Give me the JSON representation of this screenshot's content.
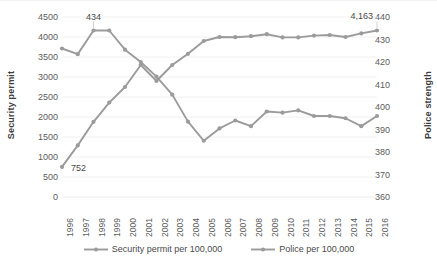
{
  "chart_data": {
    "type": "line",
    "title": "",
    "xlabel": "",
    "ylabel": "Security permit",
    "y2label": "Police strength",
    "grid": true,
    "legend_position": "bottom",
    "categories": [
      "1996",
      "1997",
      "1998",
      "1999",
      "2000",
      "2001",
      "2002",
      "2003",
      "2004",
      "2005",
      "2006",
      "2007",
      "2008",
      "2009",
      "2010",
      "2011",
      "2012",
      "2013",
      "2014",
      "2015",
      "2016"
    ],
    "ylim": [
      0,
      4500
    ],
    "yticks": [
      "0",
      "500",
      "1000",
      "1500",
      "2000",
      "2500",
      "3000",
      "3500",
      "4000",
      "4500"
    ],
    "y2lim": [
      360,
      440
    ],
    "y2ticks": [
      "360",
      "370",
      "380",
      "390",
      "400",
      "410",
      "420",
      "430",
      "440"
    ],
    "series": [
      {
        "name": "Security permit per 100,000",
        "axis": "left",
        "color": "#9b9b9b",
        "values": [
          752,
          1290,
          1880,
          2360,
          2750,
          3300,
          2900,
          3300,
          3580,
          3900,
          4000,
          3995,
          4020,
          4070,
          3990,
          3990,
          4035,
          4050,
          4000,
          4090,
          4163
        ]
      },
      {
        "name": "Police per 100,000",
        "axis": "right",
        "color": "#9b9b9b",
        "values": [
          426.0,
          423.5,
          434.0,
          434.0,
          425.5,
          420.0,
          413.5,
          405.5,
          393.5,
          385.0,
          390.5,
          394.0,
          391.5,
          398.0,
          397.5,
          398.5,
          396.0,
          396.0,
          395.0,
          391.5,
          396.0
        ]
      }
    ],
    "annotations": [
      {
        "label": "752",
        "series": "Security permit per 100,000",
        "category": "1996",
        "value": 752
      },
      {
        "label": "434",
        "series": "Police per 100,000",
        "category": "1998",
        "value": 434
      },
      {
        "label": "4,163",
        "series": "Security permit per 100,000",
        "category": "2016",
        "value": 4163
      }
    ]
  },
  "legend": {
    "items": [
      {
        "label": "Security permit per 100,000"
      },
      {
        "label": "Police per 100,000"
      }
    ]
  },
  "axes": {
    "left_title": "Security permit",
    "right_title": "Police strength"
  },
  "colors": {
    "line": "#9b9b9b",
    "grid": "#ececec",
    "text": "#5c5c5c",
    "axis_title": "#3c3c3c"
  }
}
